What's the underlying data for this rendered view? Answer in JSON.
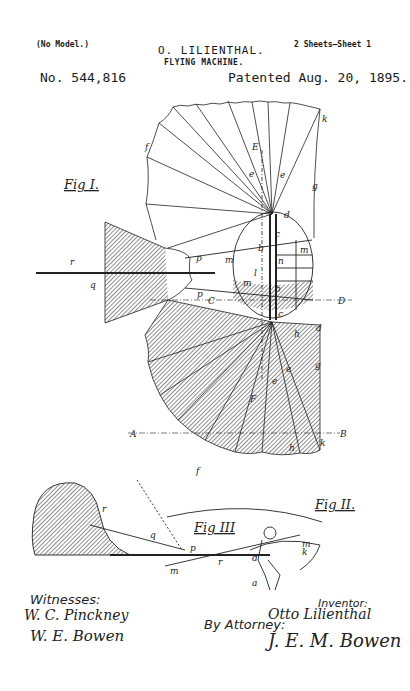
{
  "header": {
    "model_note": "(No Model.)",
    "sheets": "2 Sheets—Sheet 1",
    "inventor_name": "O. LILIENTHAL.",
    "title": "FLYING MACHINE.",
    "patent_number": "No. 544,816",
    "patent_date": "Patented Aug. 20, 1895."
  },
  "figures": {
    "fig1": "Fig I.",
    "fig2": "Fig II.",
    "fig3": "Fig III"
  },
  "reference_letters": {
    "a": "a",
    "b": "b",
    "c": "c",
    "d": "d",
    "e": "e",
    "f": "f",
    "g": "g",
    "h": "h",
    "k": "k",
    "l": "l",
    "m": "m",
    "n": "n",
    "p": "p",
    "q": "q",
    "r": "r",
    "A": "A",
    "B": "B",
    "C": "C",
    "D": "D",
    "E": "E",
    "F": "F"
  },
  "footer": {
    "witnesses_label": "Witnesses:",
    "witness_1": "W. C. Pinckney",
    "witness_2": "W. E. Bowen",
    "inventor_label": "Inventor:",
    "inventor_signature": "Otto Lilienthal",
    "attorney_label": "By Attorney:",
    "attorney_signature": "J. E. M. Bowen"
  },
  "colors": {
    "ink": "#1a1a1a",
    "paper": "#ffffff"
  }
}
